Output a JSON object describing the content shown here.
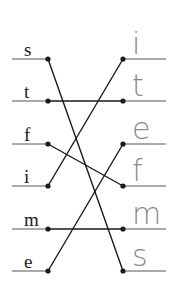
{
  "diagram": {
    "type": "matching",
    "colors": {
      "line": "#1a1a1a",
      "guide": "#555555",
      "handwriting": "#8a8a8a"
    },
    "left_items": [
      {
        "label": "s",
        "y": 59
      },
      {
        "label": "t",
        "y": 101
      },
      {
        "label": "f",
        "y": 144
      },
      {
        "label": "i",
        "y": 186
      },
      {
        "label": "m",
        "y": 229
      },
      {
        "label": "e",
        "y": 271
      }
    ],
    "right_answers": [
      {
        "label": "i",
        "y": 59
      },
      {
        "label": "t",
        "y": 101
      },
      {
        "label": "e",
        "y": 144
      },
      {
        "label": "f",
        "y": 186
      },
      {
        "label": "m",
        "y": 229
      },
      {
        "label": "s",
        "y": 271
      }
    ],
    "connections": [
      {
        "from": "s",
        "from_y": 59,
        "to_y": 271
      },
      {
        "from": "t",
        "from_y": 101,
        "to_y": 101
      },
      {
        "from": "f",
        "from_y": 144,
        "to_y": 186
      },
      {
        "from": "i",
        "from_y": 186,
        "to_y": 59
      },
      {
        "from": "m",
        "from_y": 229,
        "to_y": 229
      },
      {
        "from": "e",
        "from_y": 271,
        "to_y": 144
      }
    ],
    "geometry": {
      "left_line_x1": 12,
      "left_dot_x": 48,
      "right_dot_x": 123,
      "right_line_x2": 166
    }
  }
}
